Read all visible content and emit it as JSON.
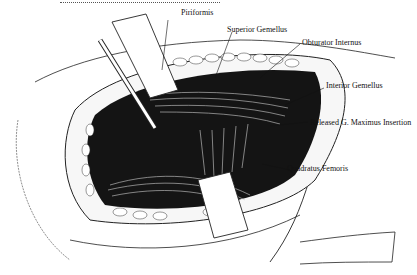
{
  "figure": {
    "type": "surgical illustration",
    "labels": [
      {
        "id": "piriformis",
        "text": "Piriformis"
      },
      {
        "id": "superior-gemellus",
        "text": "Superior Gemellus"
      },
      {
        "id": "obturator-internus",
        "text": "Obturator Internus"
      },
      {
        "id": "inferior-gemellus",
        "text": "Interior Gemellus"
      },
      {
        "id": "released-g-maximus",
        "text": "Released G. Maximus Insertion"
      },
      {
        "id": "quadratus-femoris",
        "text": "Quadratus Femoris"
      }
    ],
    "colors": {
      "ink": "#111111",
      "paper": "#ffffff",
      "shadow": "#1a1a1a"
    }
  }
}
